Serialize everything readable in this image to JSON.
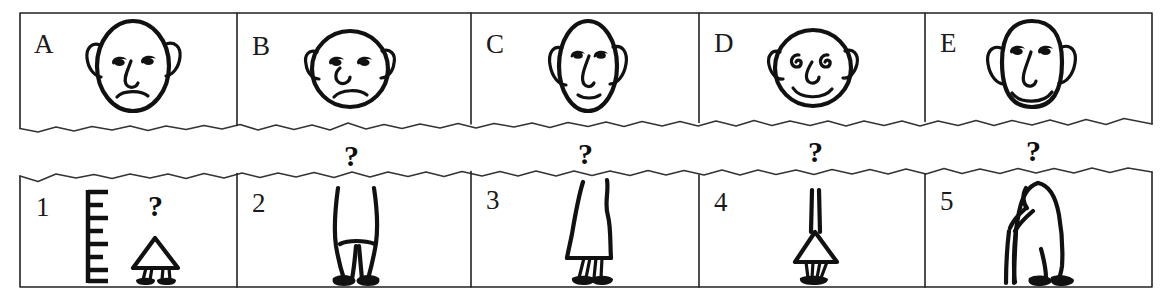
{
  "figure": {
    "row_top": {
      "name": "faces-row",
      "cells": [
        {
          "label": "A",
          "item": "face",
          "description": "oval egg-shaped bald head, droopy half-closed eyes, long hooked nose, frowning mouth, large ears",
          "head_shape": "oval",
          "mouth": "frown",
          "eyes": "droopy"
        },
        {
          "label": "B",
          "item": "face",
          "description": "round bald head, droopy half-closed eyes, small curled nose, frowning mouth, pointed ears",
          "head_shape": "round",
          "mouth": "frown",
          "eyes": "droopy"
        },
        {
          "label": "C",
          "item": "face",
          "description": "narrow tall oval head, droopy eyes, long thin nose, small straight mouth, long ears",
          "head_shape": "narrow-oval",
          "mouth": "straight",
          "eyes": "droopy"
        },
        {
          "label": "D",
          "item": "face",
          "description": "round bald head, spiral curled eyes, curved nose, broad smiling mouth, round ears",
          "head_shape": "round",
          "mouth": "smile",
          "eyes": "spiral"
        },
        {
          "label": "E",
          "item": "face",
          "description": "tall rounded-rectangle head, droopy eyes, long hooked nose, smiling mouth, large ears",
          "head_shape": "tall-rounded",
          "mouth": "smile",
          "eyes": "droopy"
        }
      ]
    },
    "row_bottom": {
      "name": "bodies-row",
      "cells": [
        {
          "label": "1",
          "item": "body",
          "description": "small child in triangular dress standing beside a height-measuring ruler",
          "body_type": "child-in-dress",
          "has_ruler": true,
          "ruler_ticks": 7,
          "question_mark": "?"
        },
        {
          "label": "2",
          "item": "body",
          "description": "tall adult figure in trousers standing upright",
          "body_type": "adult-trousers",
          "has_ruler": false,
          "question_mark": "?"
        },
        {
          "label": "3",
          "item": "body",
          "description": "adult figure in a long flared skirt or dress",
          "body_type": "adult-skirt",
          "has_ruler": false,
          "question_mark": "?"
        },
        {
          "label": "4",
          "item": "body",
          "description": "small child figure with narrow torso and short triangular skirt",
          "body_type": "child-short-skirt",
          "has_ruler": false,
          "question_mark": "?"
        },
        {
          "label": "5",
          "item": "body",
          "description": "hunched elderly figure leaning forward walking with a cane",
          "body_type": "elderly-with-cane",
          "has_ruler": false,
          "question_mark": "?"
        }
      ]
    },
    "connectors": [
      {
        "name": "connector-b",
        "symbol": "?"
      },
      {
        "name": "connector-c",
        "symbol": "?"
      },
      {
        "name": "connector-d",
        "symbol": "?"
      },
      {
        "name": "connector-e",
        "symbol": "?"
      }
    ]
  },
  "colors": {
    "ink": "#111111",
    "frame": "#222222",
    "paper": "#ffffff"
  }
}
